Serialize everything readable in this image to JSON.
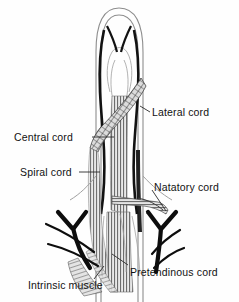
{
  "figure": {
    "kind": "anatomical-illustration",
    "background_color": "#fefefe",
    "ink_color": "#121212",
    "outline_color": "#8d8d8d",
    "fiber_color": "#6f6f6f",
    "hatch_color": "#3a3a3a"
  },
  "labels": {
    "lateral_cord": "Lateral cord",
    "central_cord": "Central cord",
    "spiral_cord": "Spiral cord",
    "natatory_cord": "Natatory cord",
    "pretendinous_cord": "Pretendinous cord",
    "intrinsic_muscle": "Intrinsic muscle"
  }
}
